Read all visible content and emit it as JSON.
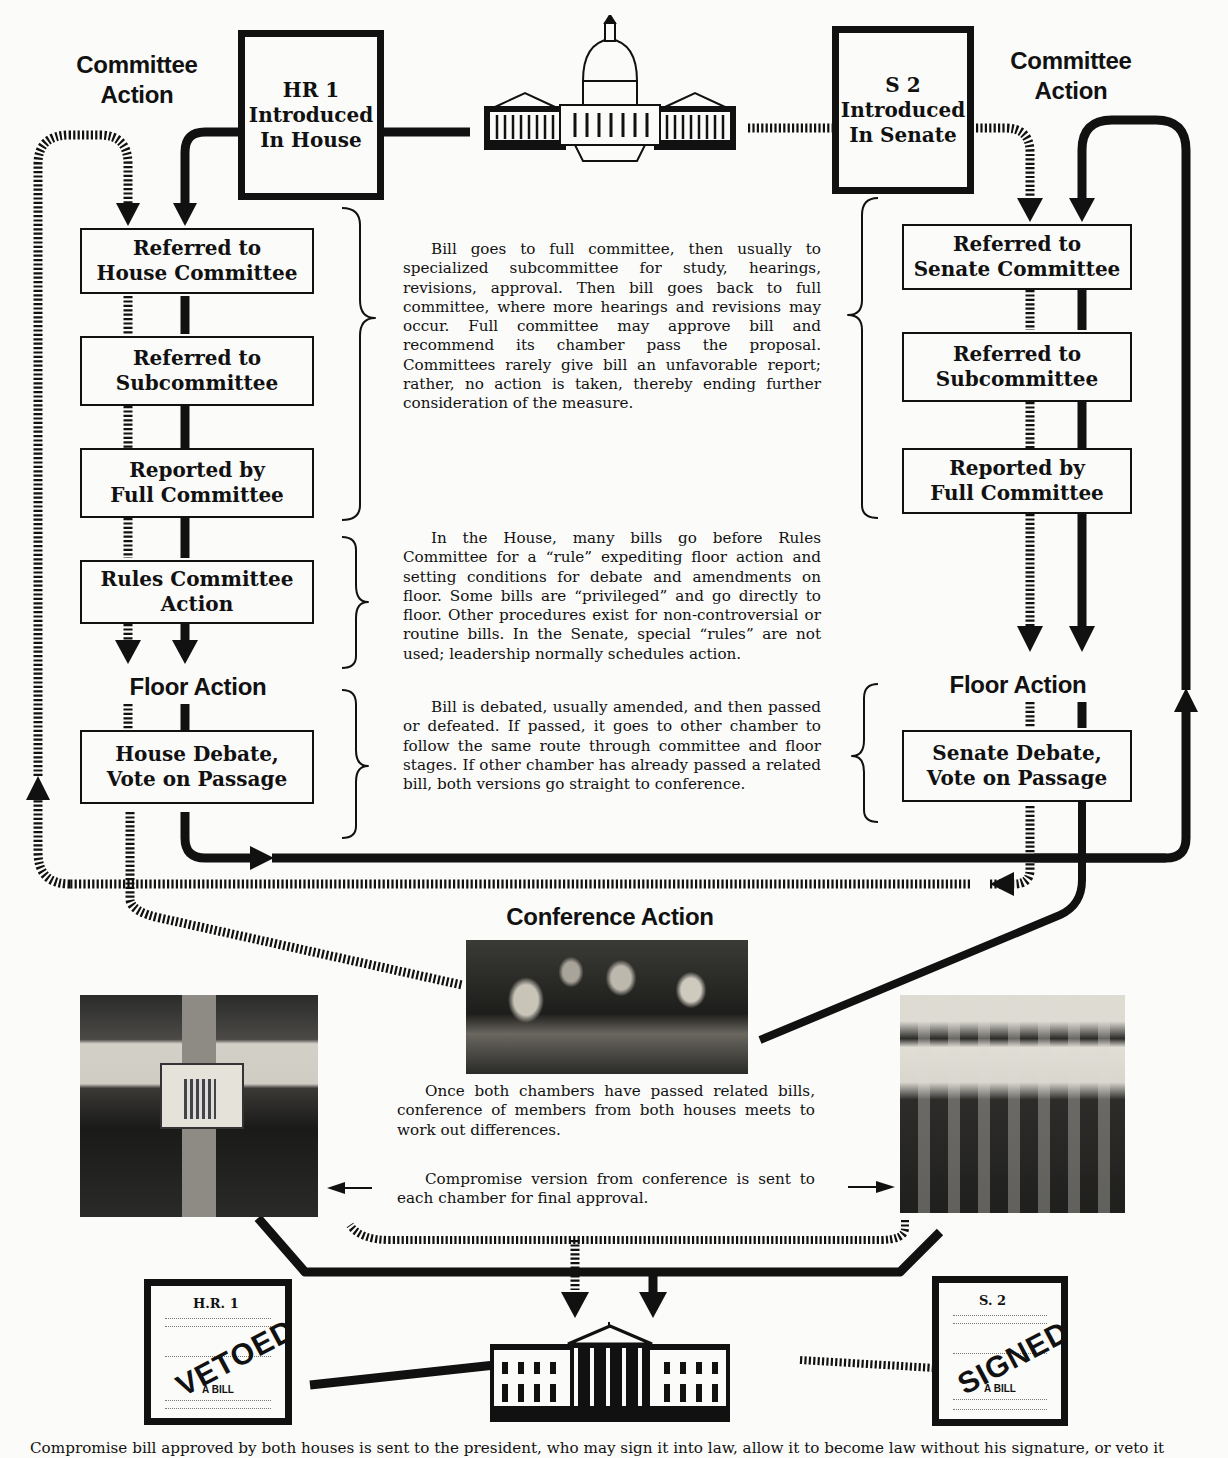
{
  "house": {
    "section_label": "Committee Action",
    "intro": {
      "line1": "HR 1",
      "line2": "Introduced",
      "line3": "In House"
    },
    "steps": [
      {
        "line1": "Referred to",
        "line2": "House Committee"
      },
      {
        "line1": "Referred to",
        "line2": "Subcommittee"
      },
      {
        "line1": "Reported by",
        "line2": "Full Committee"
      },
      {
        "line1": "Rules Committee",
        "line2": "Action"
      }
    ],
    "floor_label": "Floor Action",
    "floor_step": {
      "line1": "House Debate,",
      "line2": "Vote on Passage"
    }
  },
  "senate": {
    "section_label": "Committee Action",
    "intro": {
      "line1": "S 2",
      "line2": "Introduced",
      "line3": "In Senate"
    },
    "steps": [
      {
        "line1": "Referred to",
        "line2": "Senate Committee"
      },
      {
        "line1": "Referred to",
        "line2": "Subcommittee"
      },
      {
        "line1": "Reported by",
        "line2": "Full Committee"
      }
    ],
    "floor_label": "Floor Action",
    "floor_step": {
      "line1": "Senate Debate,",
      "line2": "Vote on Passage"
    }
  },
  "descriptions": {
    "committee": "Bill goes to full committee, then usually to specialized subcommittee for study, hearings, revisions, approval. Then bill goes back to full committee, where more hearings and revisions may occur. Full committee may approve bill and recommend its chamber pass the proposal. Committees rarely give bill an unfavorable report; rather, no action is taken, thereby ending further consideration of the measure.",
    "rules": "In the House, many bills go before Rules Committee for a “rule” expediting floor action and setting conditions for debate and amendments on floor. Some bills are “privileged” and go directly to floor. Other procedures exist for non-controversial or routine bills. In the Senate, special “rules” are not used; leadership normally schedules action.",
    "floor": "Bill is debated, usually amended, and then passed or defeated. If passed, it goes to other chamber to follow the same route through committee and floor stages. If other chamber has already passed a related bill, both versions go straight to conference."
  },
  "conference": {
    "title": "Conference Action",
    "text1": "Once both chambers have passed related bills, conference of members from both houses meets to work out differences.",
    "text2": "Compromise version from conference is sent to each chamber for final approval."
  },
  "bills": {
    "house_bill": {
      "number": "H.R. 1",
      "stamp": "VETOED",
      "label": "A BILL"
    },
    "senate_bill": {
      "number": "S. 2",
      "stamp": "SIGNED",
      "label": "A BILL"
    }
  },
  "images": {
    "capitol": "capitol-illustration",
    "house_chamber": "house-chamber-photo",
    "senate_chamber": "senate-chamber-photo",
    "conference_photo": "conference-meeting-photo",
    "white_house": "white-house-illustration"
  },
  "footer_caption": "Compromise bill approved by both houses is sent to the president, who may sign it into law, allow it to become law without his signature, or veto it"
}
